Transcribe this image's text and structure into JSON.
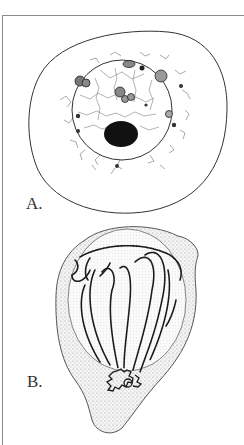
{
  "figure": {
    "panels": [
      {
        "label": "A.",
        "description": "Cell with spherical nucleus, reticular chromatin network, chromatin granules and a large dark nucleolus"
      },
      {
        "label": "B.",
        "description": "Pear-shaped cell with nucleus containing long looped chromosome threads converging in a bouquet at the base"
      }
    ],
    "colors": {
      "ink": "#1a1a1a",
      "stipple": "#9a9a9a",
      "frame": "#8a8a8a",
      "background": "#ffffff"
    }
  }
}
